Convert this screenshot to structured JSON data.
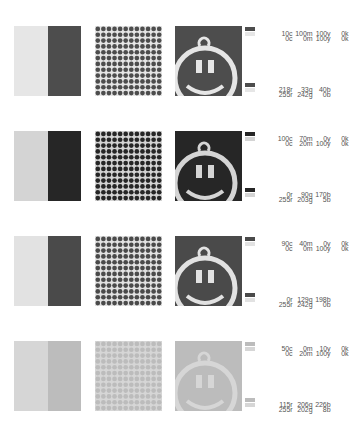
{
  "rows": [
    {
      "top": 26,
      "light": "#e6e6e6",
      "dark": "#4d4d4d",
      "cmyk": [
        {
          "c": "10c",
          "m": "100m",
          "y": "100y",
          "k": "0k"
        },
        {
          "c": "0c",
          "m": "0m",
          "y": "100y",
          "k": "0k"
        }
      ],
      "rgb": [
        {
          "r": "218r",
          "g": "33g",
          "b": "40b"
        },
        {
          "r": "255r",
          "g": "242g",
          "b": "0b"
        }
      ]
    },
    {
      "top": 131,
      "light": "#d4d4d4",
      "dark": "#262626",
      "cmyk": [
        {
          "c": "100c",
          "m": "70m",
          "y": "0y",
          "k": "0k"
        },
        {
          "c": "0c",
          "m": "20m",
          "y": "100y",
          "k": "0k"
        }
      ],
      "rgb": [
        {
          "r": "0r",
          "g": "90g",
          "b": "170b"
        },
        {
          "r": "255r",
          "g": "203g",
          "b": "5b"
        }
      ]
    },
    {
      "top": 236,
      "light": "#e2e2e2",
      "dark": "#4a4a4a",
      "cmyk": [
        {
          "c": "90c",
          "m": "40m",
          "y": "0y",
          "k": "0k"
        },
        {
          "c": "0c",
          "m": "0m",
          "y": "100y",
          "k": "0k"
        }
      ],
      "rgb": [
        {
          "r": "0r",
          "g": "129g",
          "b": "198b"
        },
        {
          "r": "255r",
          "g": "242g",
          "b": "0b"
        }
      ]
    },
    {
      "top": 341,
      "light": "#d6d6d6",
      "dark": "#bcbcbc",
      "cmyk": [
        {
          "c": "50c",
          "m": "0m",
          "y": "10y",
          "k": "0k"
        },
        {
          "c": "0c",
          "m": "20m",
          "y": "100y",
          "k": "0k"
        }
      ],
      "rgb": [
        {
          "r": "115r",
          "g": "206g",
          "b": "226b"
        },
        {
          "r": "255r",
          "g": "202g",
          "b": "8b"
        }
      ]
    }
  ]
}
